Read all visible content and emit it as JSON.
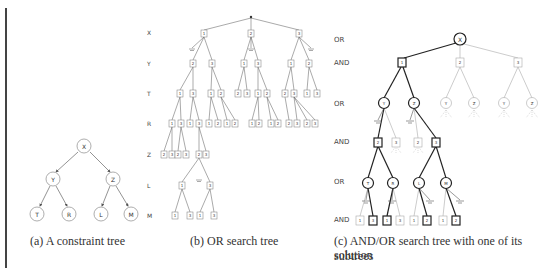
{
  "figure": {
    "captions": {
      "a": "(a) A constraint tree",
      "b": "(b) OR search tree",
      "c_line1": "(c) AND/OR search tree with one of its solution",
      "c_line2": "subtrees"
    },
    "constraint_tree": {
      "root": "X",
      "level2": [
        "Y",
        "Z"
      ],
      "leaves": [
        "T",
        "R",
        "L",
        "M"
      ]
    },
    "or_search_tree": {
      "level_labels": [
        "X",
        "Y",
        "T",
        "R",
        "Z",
        "L",
        "M"
      ],
      "x_values": [
        "1",
        "2",
        "3"
      ],
      "y_values": [
        "2",
        "3",
        "1",
        "3",
        "1",
        "2"
      ],
      "t_values": [
        "1",
        "3",
        "1",
        "2",
        "2",
        "3",
        "1",
        "2",
        "2",
        "3",
        "1",
        "3"
      ],
      "r_values": [
        "1",
        "3",
        "1",
        "3",
        "1",
        "2",
        "1",
        "2",
        "1",
        "2",
        "1",
        "2",
        "2",
        "3",
        "2",
        "3"
      ],
      "z_values": [
        "2",
        "3",
        "2",
        "3",
        "2",
        "3"
      ],
      "l_values": [
        "1",
        "3"
      ],
      "m_values": [
        "1",
        "3",
        "1",
        "3"
      ]
    },
    "and_or_tree": {
      "level_labels": [
        "OR",
        "AND",
        "OR",
        "AND",
        "OR",
        "AND"
      ],
      "root": "X",
      "x_values": [
        "1",
        "2",
        "3"
      ],
      "or_vars_level2": [
        "Y",
        "Z",
        "Y",
        "Z",
        "Y",
        "Z"
      ],
      "and_values_level2": [
        "2",
        "3",
        "2",
        "3"
      ],
      "or_vars_level3": [
        "T",
        "R",
        "L",
        "M"
      ],
      "leaf_values": [
        "1",
        "3",
        "1",
        "3",
        "1",
        "2",
        "1",
        "2"
      ]
    }
  }
}
